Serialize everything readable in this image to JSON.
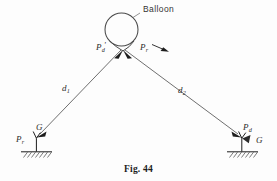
{
  "figure": {
    "caption": "Fig. 44",
    "balloon_label": "Balloon",
    "background_color": "#fdfdfd",
    "ink_color": "#2b2b2b"
  },
  "labels": {
    "apex_left_force": {
      "base": "P",
      "sub": "d",
      "prime": "'"
    },
    "apex_right_force": {
      "base": "P",
      "sub": "r",
      "prime": ""
    },
    "cable_left": {
      "base": "d",
      "sub": "1",
      "prime": ""
    },
    "cable_right": {
      "base": "d",
      "sub": "2",
      "prime": ""
    },
    "left_support_g": {
      "base": "G",
      "sub": "",
      "prime": ""
    },
    "left_support_force": {
      "base": "P",
      "sub": "r",
      "prime": ""
    },
    "right_support_force": {
      "base": "P",
      "sub": "d",
      "prime": ""
    },
    "right_support_g": {
      "base": "G",
      "sub": "",
      "prime": ""
    }
  },
  "geometry": {
    "balloon_center_x": 121.5,
    "balloon_center_y": 29.5,
    "balloon_radius": 16.5,
    "apex_x": 123,
    "apex_y": 51,
    "left_anchor_x": 36,
    "left_anchor_y": 138,
    "right_anchor_x": 242,
    "right_anchor_y": 138,
    "ground_y": 152
  }
}
